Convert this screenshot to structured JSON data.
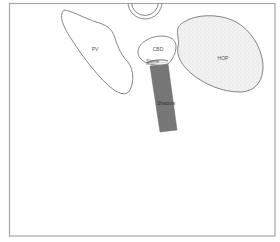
{
  "diagram": {
    "type": "ultrasound-schematic",
    "frame": {
      "stroke": "#a8a8a8"
    },
    "structures": [
      {
        "id": "probe",
        "label": "",
        "kind": "transducer-arc"
      },
      {
        "id": "pv",
        "label": "PV",
        "kind": "outline"
      },
      {
        "id": "cbd",
        "label": "CBD",
        "kind": "outline"
      },
      {
        "id": "stone",
        "label": "Stone",
        "kind": "echogenic-focus"
      },
      {
        "id": "shadow",
        "label": "Shadow",
        "kind": "acoustic-shadow",
        "color": "#777777"
      },
      {
        "id": "hop",
        "label": "HOP",
        "kind": "stippled-outline",
        "color": "#eeeeee"
      }
    ],
    "labels": {
      "pv": "PV",
      "cbd": "CBD",
      "stone": "Stone",
      "shadow": "Shadow",
      "hop": "HOP"
    },
    "colors": {
      "outline": "#777777",
      "shadow_fill": "#777777",
      "hop_fill": "#eeeeee",
      "background": "#ffffff"
    }
  }
}
